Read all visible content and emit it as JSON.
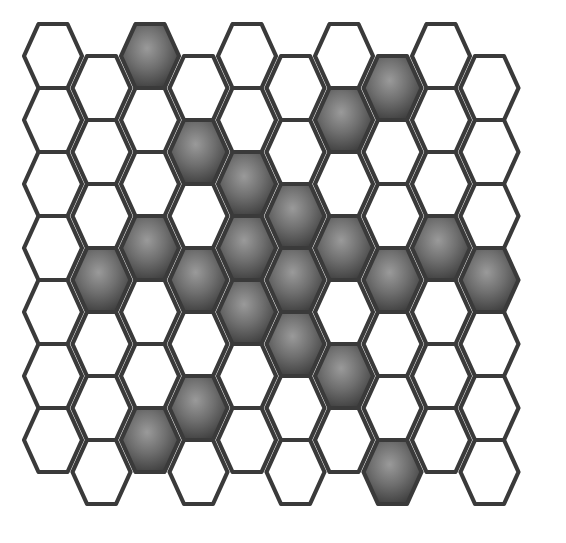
{
  "figure": {
    "width": 566,
    "height": 543,
    "background_color": "#ffffff",
    "outline_color": "#3a3a3a",
    "filled_color": "#5e5e5e",
    "filled_color_center": "#8a8a8a",
    "filled_color_edge": "#3d3d3d",
    "empty_color": "#ffffff"
  },
  "chart_data": {
    "type": "heatmap",
    "xlabel": "",
    "ylabel": "",
    "lattice": {
      "orientation": "flat-top",
      "arrangement": "staggered-columns",
      "columns": 10,
      "rows_even_column": 7,
      "rows_odd_column": 7,
      "hex_width": 58,
      "hex_height": 64,
      "column_step": 48.5,
      "row_step": 64,
      "odd_column_y_offset": 32,
      "origin_x": 53,
      "origin_y": 56
    },
    "legend": [
      {
        "label": "filled cell",
        "value": 1,
        "color": "#5e5e5e"
      },
      {
        "label": "empty cell",
        "value": 0,
        "color": "#ffffff"
      }
    ],
    "columns": [
      {
        "index": 0,
        "offset": false,
        "cells": [
          0,
          0,
          0,
          0,
          0,
          0,
          0
        ]
      },
      {
        "index": 1,
        "offset": true,
        "cells": [
          0,
          0,
          0,
          1,
          0,
          0,
          0
        ]
      },
      {
        "index": 2,
        "offset": false,
        "cells": [
          1,
          0,
          0,
          1,
          0,
          0,
          1
        ]
      },
      {
        "index": 3,
        "offset": true,
        "cells": [
          0,
          1,
          0,
          1,
          0,
          1,
          0
        ]
      },
      {
        "index": 4,
        "offset": false,
        "cells": [
          0,
          0,
          1,
          1,
          1,
          0,
          0
        ]
      },
      {
        "index": 5,
        "offset": true,
        "cells": [
          0,
          0,
          1,
          1,
          1,
          0,
          0
        ]
      },
      {
        "index": 6,
        "offset": false,
        "cells": [
          0,
          1,
          0,
          1,
          0,
          1,
          0
        ]
      },
      {
        "index": 7,
        "offset": true,
        "cells": [
          1,
          0,
          0,
          1,
          0,
          0,
          1
        ]
      },
      {
        "index": 8,
        "offset": false,
        "cells": [
          0,
          0,
          0,
          1,
          0,
          0,
          0
        ]
      },
      {
        "index": 9,
        "offset": true,
        "cells": [
          0,
          0,
          0,
          1,
          0,
          0,
          0
        ]
      }
    ],
    "filled_count": 30,
    "empty_count": 40,
    "total_cells": 70
  }
}
